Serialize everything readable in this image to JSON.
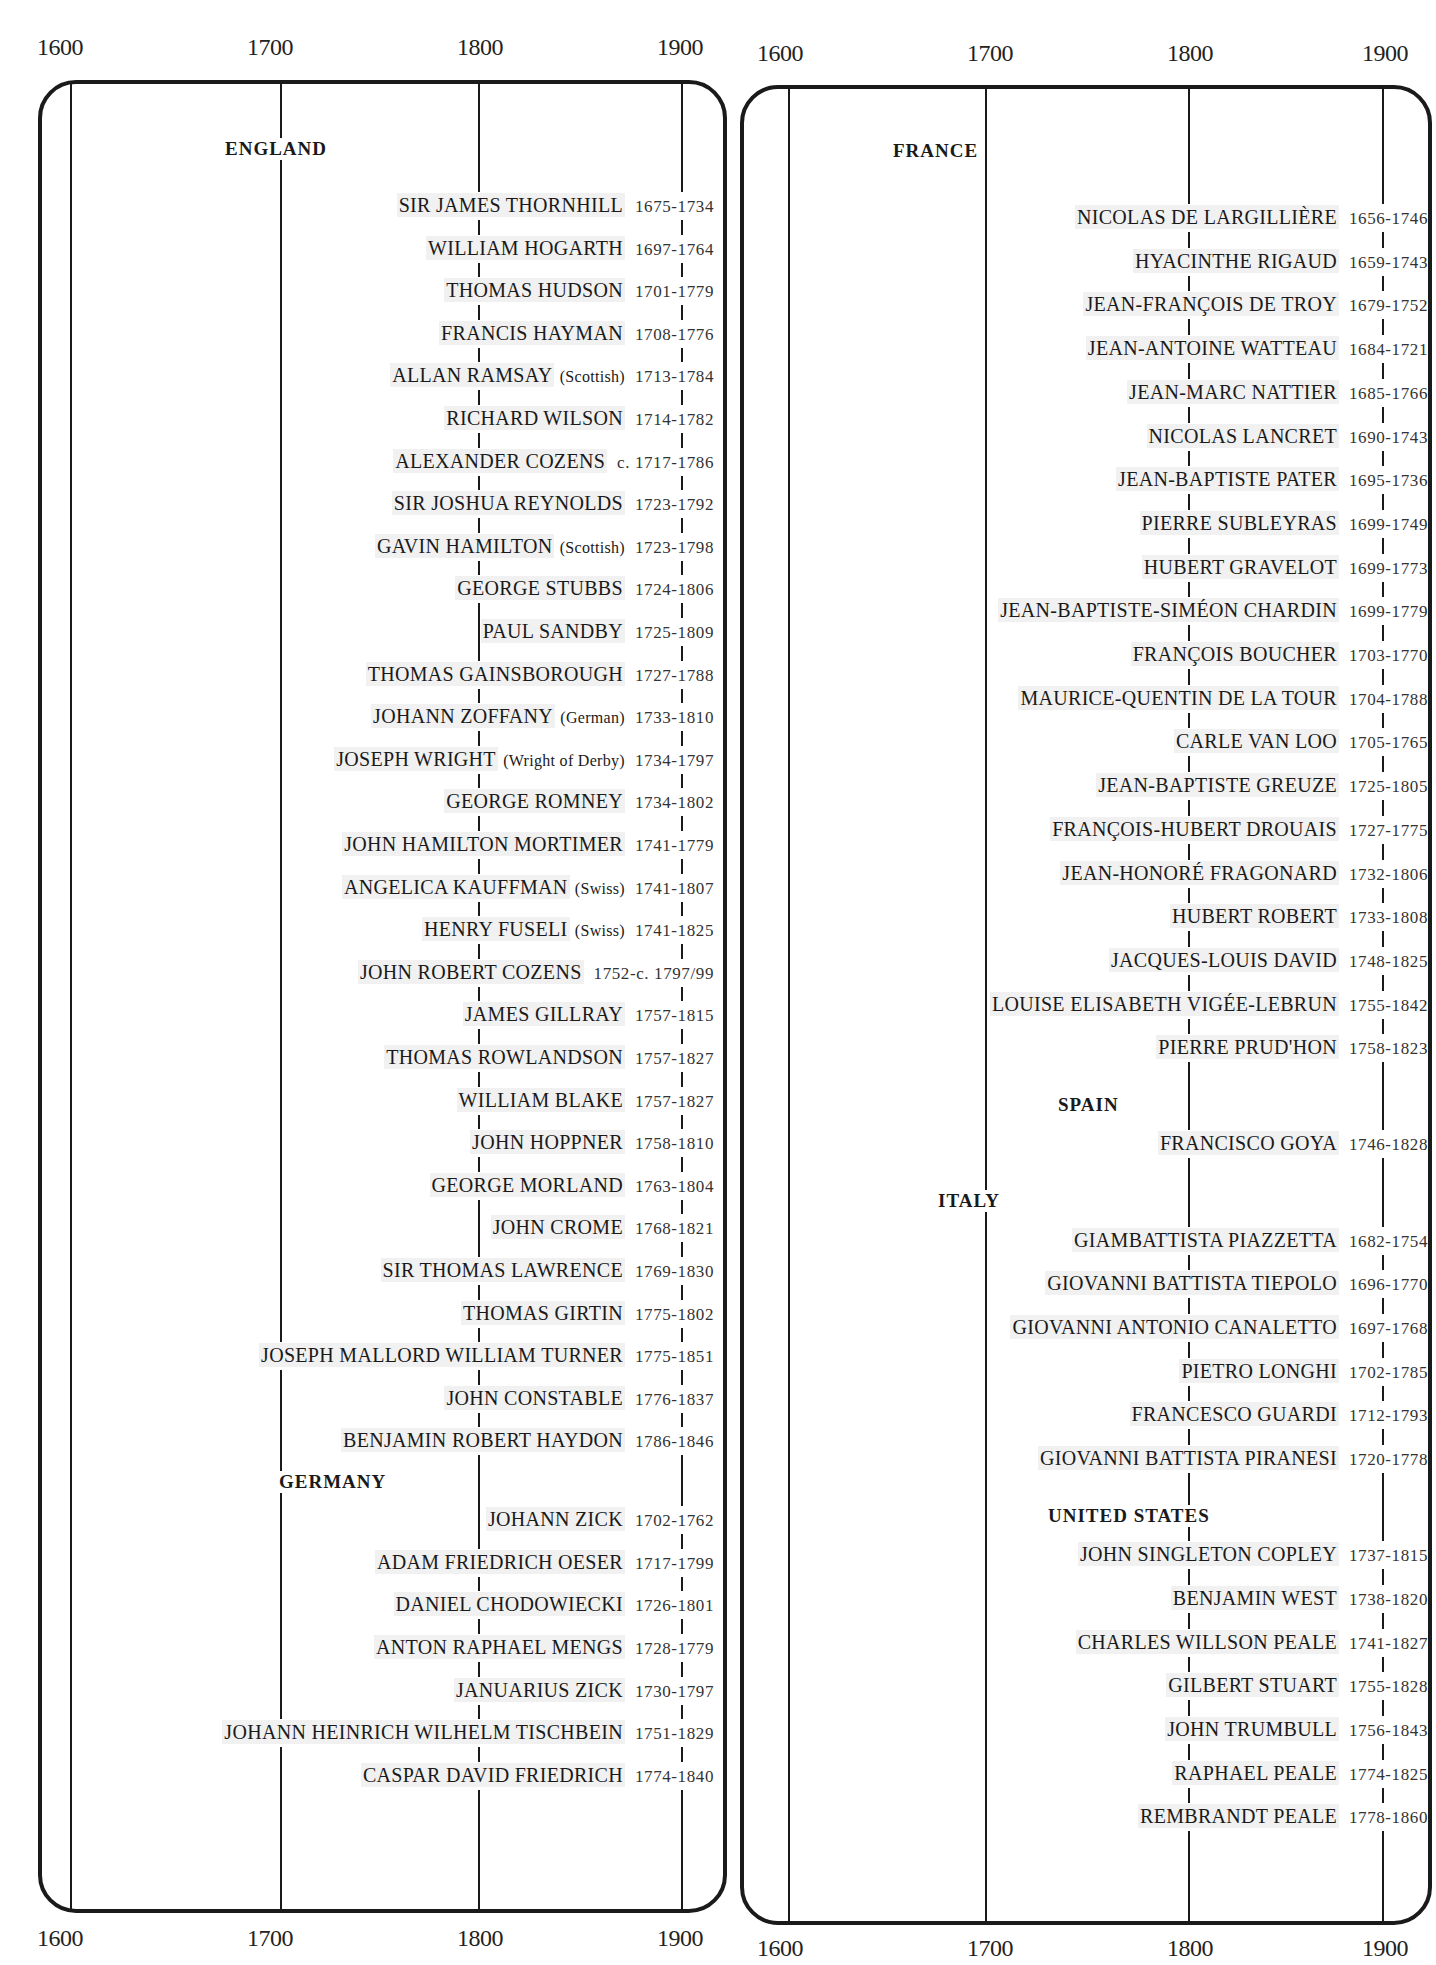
{
  "chart_data": {
    "type": "table",
    "title": "",
    "axis": {
      "ticks": [
        "1600",
        "1700",
        "1800",
        "1900"
      ],
      "range": [
        1600,
        1900
      ]
    },
    "panels": [
      {
        "sections": [
          {
            "country": "ENGLAND",
            "artists": [
              {
                "name": "SIR JAMES THORNHILL",
                "note": "",
                "dates": "1675-1734"
              },
              {
                "name": "WILLIAM HOGARTH",
                "note": "",
                "dates": "1697-1764"
              },
              {
                "name": "THOMAS HUDSON",
                "note": "",
                "dates": "1701-1779"
              },
              {
                "name": "FRANCIS HAYMAN",
                "note": "",
                "dates": "1708-1776"
              },
              {
                "name": "ALLAN RAMSAY",
                "note": "(Scottish)",
                "dates": "1713-1784"
              },
              {
                "name": "RICHARD WILSON",
                "note": "",
                "dates": "1714-1782"
              },
              {
                "name": "ALEXANDER COZENS",
                "note": "",
                "dates": "c. 1717-1786"
              },
              {
                "name": "SIR JOSHUA REYNOLDS",
                "note": "",
                "dates": "1723-1792"
              },
              {
                "name": "GAVIN HAMILTON",
                "note": "(Scottish)",
                "dates": "1723-1798"
              },
              {
                "name": "GEORGE STUBBS",
                "note": "",
                "dates": "1724-1806"
              },
              {
                "name": "PAUL SANDBY",
                "note": "",
                "dates": "1725-1809"
              },
              {
                "name": "THOMAS GAINSBOROUGH",
                "note": "",
                "dates": "1727-1788"
              },
              {
                "name": "JOHANN ZOFFANY",
                "note": "(German)",
                "dates": "1733-1810"
              },
              {
                "name": "JOSEPH WRIGHT",
                "note": "(Wright of Derby)",
                "dates": "1734-1797"
              },
              {
                "name": "GEORGE ROMNEY",
                "note": "",
                "dates": "1734-1802"
              },
              {
                "name": "JOHN HAMILTON MORTIMER",
                "note": "",
                "dates": "1741-1779"
              },
              {
                "name": "ANGELICA KAUFFMAN",
                "note": "(Swiss)",
                "dates": "1741-1807"
              },
              {
                "name": "HENRY FUSELI",
                "note": "(Swiss)",
                "dates": "1741-1825"
              },
              {
                "name": "JOHN ROBERT COZENS",
                "note": "",
                "dates": "1752-c. 1797/99"
              },
              {
                "name": "JAMES GILLRAY",
                "note": "",
                "dates": "1757-1815"
              },
              {
                "name": "THOMAS ROWLANDSON",
                "note": "",
                "dates": "1757-1827"
              },
              {
                "name": "WILLIAM BLAKE",
                "note": "",
                "dates": "1757-1827"
              },
              {
                "name": "JOHN HOPPNER",
                "note": "",
                "dates": "1758-1810"
              },
              {
                "name": "GEORGE MORLAND",
                "note": "",
                "dates": "1763-1804"
              },
              {
                "name": "JOHN CROME",
                "note": "",
                "dates": "1768-1821"
              },
              {
                "name": "SIR THOMAS LAWRENCE",
                "note": "",
                "dates": "1769-1830"
              },
              {
                "name": "THOMAS GIRTIN",
                "note": "",
                "dates": "1775-1802"
              },
              {
                "name": "JOSEPH MALLORD WILLIAM TURNER",
                "note": "",
                "dates": "1775-1851"
              },
              {
                "name": "JOHN CONSTABLE",
                "note": "",
                "dates": "1776-1837"
              },
              {
                "name": "BENJAMIN ROBERT HAYDON",
                "note": "",
                "dates": "1786-1846"
              }
            ]
          },
          {
            "country": "GERMANY",
            "artists": [
              {
                "name": "JOHANN ZICK",
                "note": "",
                "dates": "1702-1762"
              },
              {
                "name": "ADAM FRIEDRICH OESER",
                "note": "",
                "dates": "1717-1799"
              },
              {
                "name": "DANIEL CHODOWIECKI",
                "note": "",
                "dates": "1726-1801"
              },
              {
                "name": "ANTON RAPHAEL MENGS",
                "note": "",
                "dates": "1728-1779"
              },
              {
                "name": "JANUARIUS ZICK",
                "note": "",
                "dates": "1730-1797"
              },
              {
                "name": "JOHANN HEINRICH WILHELM TISCHBEIN",
                "note": "",
                "dates": "1751-1829"
              },
              {
                "name": "CASPAR DAVID FRIEDRICH",
                "note": "",
                "dates": "1774-1840"
              }
            ]
          }
        ]
      },
      {
        "sections": [
          {
            "country": "FRANCE",
            "artists": [
              {
                "name": "NICOLAS DE LARGILLIÈRE",
                "note": "",
                "dates": "1656-1746"
              },
              {
                "name": "HYACINTHE RIGAUD",
                "note": "",
                "dates": "1659-1743"
              },
              {
                "name": "JEAN-FRANÇOIS DE TROY",
                "note": "",
                "dates": "1679-1752"
              },
              {
                "name": "JEAN-ANTOINE WATTEAU",
                "note": "",
                "dates": "1684-1721"
              },
              {
                "name": "JEAN-MARC NATTIER",
                "note": "",
                "dates": "1685-1766"
              },
              {
                "name": "NICOLAS LANCRET",
                "note": "",
                "dates": "1690-1743"
              },
              {
                "name": "JEAN-BAPTISTE PATER",
                "note": "",
                "dates": "1695-1736"
              },
              {
                "name": "PIERRE SUBLEYRAS",
                "note": "",
                "dates": "1699-1749"
              },
              {
                "name": "HUBERT GRAVELOT",
                "note": "",
                "dates": "1699-1773"
              },
              {
                "name": "JEAN-BAPTISTE-SIMÉON CHARDIN",
                "note": "",
                "dates": "1699-1779"
              },
              {
                "name": "FRANÇOIS BOUCHER",
                "note": "",
                "dates": "1703-1770"
              },
              {
                "name": "MAURICE-QUENTIN DE LA TOUR",
                "note": "",
                "dates": "1704-1788"
              },
              {
                "name": "CARLE VAN LOO",
                "note": "",
                "dates": "1705-1765"
              },
              {
                "name": "JEAN-BAPTISTE GREUZE",
                "note": "",
                "dates": "1725-1805"
              },
              {
                "name": "FRANÇOIS-HUBERT DROUAIS",
                "note": "",
                "dates": "1727-1775"
              },
              {
                "name": "JEAN-HONORÉ FRAGONARD",
                "note": "",
                "dates": "1732-1806"
              },
              {
                "name": "HUBERT ROBERT",
                "note": "",
                "dates": "1733-1808"
              },
              {
                "name": "JACQUES-LOUIS DAVID",
                "note": "",
                "dates": "1748-1825"
              },
              {
                "name": "LOUISE ELISABETH VIGÉE-LEBRUN",
                "note": "",
                "dates": "1755-1842"
              },
              {
                "name": "PIERRE PRUD'HON",
                "note": "",
                "dates": "1758-1823"
              }
            ]
          },
          {
            "country": "SPAIN",
            "artists": [
              {
                "name": "FRANCISCO GOYA",
                "note": "",
                "dates": "1746-1828"
              }
            ]
          },
          {
            "country": "ITALY",
            "artists": [
              {
                "name": "GIAMBATTISTA PIAZZETTA",
                "note": "",
                "dates": "1682-1754"
              },
              {
                "name": "GIOVANNI BATTISTA TIEPOLO",
                "note": "",
                "dates": "1696-1770"
              },
              {
                "name": "GIOVANNI ANTONIO CANALETTO",
                "note": "",
                "dates": "1697-1768"
              },
              {
                "name": "PIETRO LONGHI",
                "note": "",
                "dates": "1702-1785"
              },
              {
                "name": "FRANCESCO GUARDI",
                "note": "",
                "dates": "1712-1793"
              },
              {
                "name": "GIOVANNI BATTISTA PIRANESI",
                "note": "",
                "dates": "1720-1778"
              }
            ]
          },
          {
            "country": "UNITED STATES",
            "artists": [
              {
                "name": "JOHN SINGLETON COPLEY",
                "note": "",
                "dates": "1737-1815"
              },
              {
                "name": "BENJAMIN WEST",
                "note": "",
                "dates": "1738-1820"
              },
              {
                "name": "CHARLES WILLSON PEALE",
                "note": "",
                "dates": "1741-1827"
              },
              {
                "name": "GILBERT STUART",
                "note": "",
                "dates": "1755-1828"
              },
              {
                "name": "JOHN TRUMBULL",
                "note": "",
                "dates": "1756-1843"
              },
              {
                "name": "RAPHAEL PEALE",
                "note": "",
                "dates": "1774-1825"
              },
              {
                "name": "REMBRANDT PEALE",
                "note": "",
                "dates": "1778-1860"
              }
            ]
          }
        ]
      }
    ],
    "grid": true,
    "legend": null
  },
  "colors": {
    "ink": "#1a1a1a",
    "highlight": "rgba(0,0,0,0.055)",
    "background": "#ffffff"
  }
}
